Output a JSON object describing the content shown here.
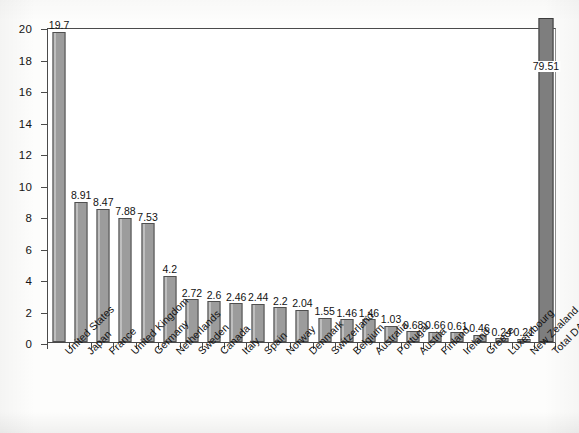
{
  "chart_data": {
    "type": "bar",
    "title": "Net ODA In 2004",
    "xlabel": "",
    "ylabel": "",
    "ylim": [
      0,
      20
    ],
    "ytick_step": 2,
    "ytick_labels": [
      "0",
      "2",
      "4",
      "6",
      "8",
      "10",
      "12",
      "14",
      "16",
      "18",
      "20"
    ],
    "grid": false,
    "legend": "none",
    "note": "Total DAC bar value 79.51 exceeds the axis maximum and is clipped at the top of the plot frame.",
    "categories": [
      "United States",
      "Japan",
      "France",
      "United Kingdom",
      "Germany",
      "Netherlands",
      "Sweden",
      "Canada",
      "Italy",
      "Spain",
      "Norway",
      "Denmark",
      "Switzerland",
      "Belgium",
      "Australia",
      "Portugal",
      "Austria",
      "Finland",
      "Ireland",
      "Greece",
      "Luxembourg",
      "New Zealand",
      "Total DAC"
    ],
    "values": [
      19.7,
      8.91,
      8.47,
      7.88,
      7.53,
      4.2,
      2.72,
      2.6,
      2.46,
      2.44,
      2.2,
      2.04,
      1.55,
      1.46,
      1.46,
      1.03,
      0.68,
      0.66,
      0.61,
      0.46,
      0.24,
      0.21,
      79.51
    ],
    "value_labels": [
      "19.7",
      "8.91",
      "8.47",
      "7.88",
      "7.53",
      "4.2",
      "2.72",
      "2.6",
      "2.46",
      "2.44",
      "2.2",
      "2.04",
      "1.55",
      "1.46",
      "1.46",
      "1.03",
      "0.68",
      "0.66",
      "0.61",
      "0.46",
      "0.24",
      "0.21",
      "79.51"
    ],
    "colors": {
      "bar_fill": "#9c9c9c",
      "bar_border": "#4f4f4f",
      "total_fill": "#7e7e7e",
      "axis": "#4a4a4a",
      "text": "#131313",
      "background": "#ffffff"
    }
  }
}
